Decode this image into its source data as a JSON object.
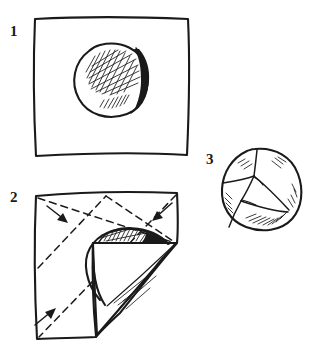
{
  "figure": {
    "medium": "pen-and-ink line drawing",
    "background_color": "#ffffff",
    "ink_color": "#1a1a1a",
    "width": 318,
    "height": 355,
    "steps": [
      {
        "number": "1",
        "label_position": {
          "x": 10,
          "y": 24
        },
        "caption": "Ball placed at the centre of the open square cloth",
        "elements": [
          "square-cloth-outline",
          "ball-outline",
          "ball-cross-hatch-shading",
          "ball-rim-shadow"
        ]
      },
      {
        "number": "2",
        "label_position": {
          "x": 10,
          "y": 190
        },
        "caption": "Diagonal fold lines marked; corners drawn in toward the ball",
        "elements": [
          "cloth-outline",
          "diagonal-fold-dashed-lines",
          "folded-corner-flap",
          "partly-covered-ball",
          "fold-direction-arrows"
        ],
        "arrow_count": 3
      },
      {
        "number": "3",
        "label_position": {
          "x": 206,
          "y": 152
        },
        "caption": "Finished wrapped bundle with corners gathered over the ball",
        "elements": [
          "wrapped-bundle-outline",
          "seam-lines",
          "fabric-crease-shading"
        ]
      }
    ]
  }
}
